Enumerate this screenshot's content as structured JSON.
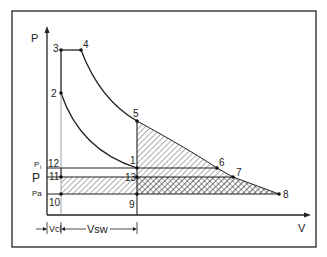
{
  "diagram": {
    "axes": {
      "y_label": "P",
      "x_label": "V"
    },
    "pressure_labels": {
      "pi": "P",
      "pi_sub": "i",
      "p": "P",
      "pa": "Pa"
    },
    "volume_labels": {
      "vcl": "Vcl",
      "vsw": "Vsw"
    },
    "points": {
      "p1": "1",
      "p2": "2",
      "p3": "3",
      "p4": "4",
      "p5": "5",
      "p6": "6",
      "p7": "7",
      "p8": "8",
      "p9": "9",
      "p10": "10",
      "p11": "11",
      "p12": "12",
      "p13": "13"
    }
  }
}
